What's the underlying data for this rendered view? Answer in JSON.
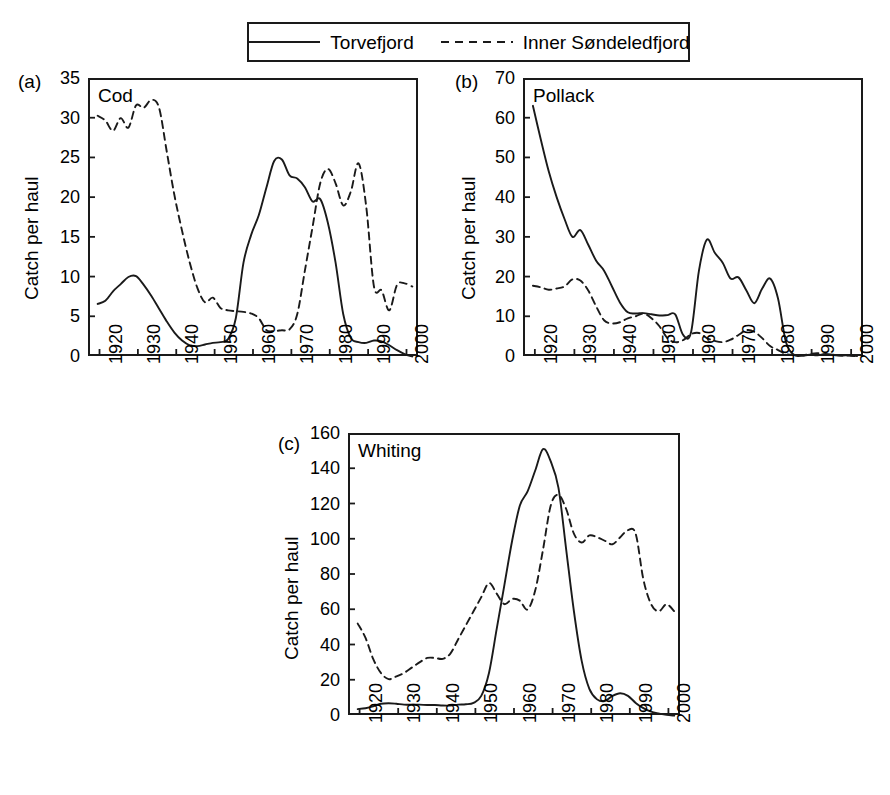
{
  "legend": {
    "entries": [
      {
        "label": "Torvefjord",
        "style": "solid",
        "icon": "solid-line-icon"
      },
      {
        "label": "Inner Søndeledfjord",
        "style": "dashed",
        "icon": "dashed-line-icon"
      }
    ]
  },
  "axis_title": "Catch per haul",
  "panels": [
    {
      "tag": "(a)",
      "title": "Cod"
    },
    {
      "tag": "(b)",
      "title": "Pollack"
    },
    {
      "tag": "(c)",
      "title": "Whiting"
    }
  ],
  "chart_data": [
    {
      "type": "line",
      "panel": "(a)",
      "title": "Cod",
      "xlabel": "",
      "ylabel": "Catch per haul",
      "xlim": [
        1917,
        2003
      ],
      "ylim": [
        0,
        35
      ],
      "yticks": [
        0,
        5,
        10,
        15,
        20,
        25,
        30,
        35
      ],
      "xticks": [
        1920,
        1930,
        1940,
        1950,
        1960,
        1970,
        1980,
        1990,
        2000
      ],
      "grid": false,
      "legend_position": "top-center-figure",
      "x": [
        1919,
        1921,
        1923,
        1925,
        1927,
        1929,
        1931,
        1933,
        1935,
        1937,
        1939,
        1941,
        1943,
        1945,
        1947,
        1949,
        1951,
        1953,
        1955,
        1957,
        1959,
        1961,
        1963,
        1965,
        1967,
        1969,
        1971,
        1973,
        1975,
        1977,
        1979,
        1981,
        1983,
        1985,
        1987,
        1989,
        1991,
        1993,
        1995,
        1997,
        1999,
        2001
      ],
      "series": [
        {
          "name": "Torvefjord",
          "style": "solid",
          "values": [
            6.8,
            7.2,
            8.4,
            9.3,
            10.2,
            10.3,
            9.2,
            7.8,
            6.2,
            4.6,
            3.2,
            2.2,
            1.6,
            1.5,
            1.7,
            1.9,
            2.0,
            2.4,
            5.0,
            12.0,
            15.5,
            18.0,
            21.5,
            24.8,
            25.0,
            23.0,
            22.6,
            21.5,
            19.7,
            20.0,
            17.0,
            12.0,
            5.5,
            2.5,
            2.0,
            1.9,
            2.2,
            2.1,
            1.6,
            1.0,
            0.5,
            0.2
          ]
        },
        {
          "name": "Inner Søndeledfjord",
          "style": "dashed",
          "values": [
            30.5,
            29.9,
            28.6,
            30.2,
            29.0,
            31.8,
            31.5,
            32.5,
            31.5,
            26.0,
            20.5,
            16.0,
            12.0,
            8.8,
            7.0,
            7.6,
            6.3,
            6.0,
            5.9,
            5.8,
            5.6,
            5.0,
            3.5,
            3.4,
            3.5,
            3.6,
            5.5,
            11.0,
            16.5,
            22.0,
            23.8,
            22.0,
            19.2,
            21.0,
            24.5,
            19.0,
            9.0,
            8.5,
            6.0,
            9.2,
            9.4,
            9.0
          ]
        }
      ]
    },
    {
      "type": "line",
      "panel": "(b)",
      "title": "Pollack",
      "xlabel": "",
      "ylabel": "Catch per haul",
      "xlim": [
        1917,
        2003
      ],
      "ylim": [
        0,
        70
      ],
      "yticks": [
        0,
        10,
        20,
        30,
        40,
        50,
        60,
        70
      ],
      "xticks": [
        1920,
        1930,
        1940,
        1950,
        1960,
        1970,
        1980,
        1990,
        2000
      ],
      "grid": false,
      "legend_position": "top-center-figure",
      "x": [
        1919,
        1921,
        1923,
        1925,
        1927,
        1929,
        1931,
        1933,
        1935,
        1937,
        1939,
        1941,
        1943,
        1945,
        1947,
        1949,
        1951,
        1953,
        1955,
        1957,
        1959,
        1961,
        1963,
        1965,
        1967,
        1969,
        1971,
        1973,
        1975,
        1977,
        1979,
        1981,
        1983,
        1985,
        1987,
        1989,
        1991,
        1993,
        1995,
        1997,
        1999,
        2001
      ],
      "series": [
        {
          "name": "Torvefjord",
          "style": "solid",
          "values": [
            63.5,
            55.0,
            47.0,
            40.5,
            35.0,
            30.5,
            32.2,
            28.5,
            24.5,
            22.0,
            18.0,
            14.0,
            11.5,
            11.2,
            11.3,
            11.0,
            10.7,
            10.8,
            11.0,
            5.8,
            6.5,
            22.0,
            29.8,
            26.5,
            24.0,
            20.0,
            20.3,
            17.0,
            13.8,
            17.5,
            20.0,
            15.0,
            4.0,
            0.8,
            0.6,
            0.8,
            0.7,
            1.0,
            0.8,
            0.6,
            0.7,
            0.5
          ]
        },
        {
          "name": "Inner Søndeledfjord",
          "style": "dashed",
          "values": [
            18.2,
            17.8,
            17.2,
            17.5,
            18.0,
            19.8,
            19.5,
            17.0,
            13.0,
            9.5,
            8.7,
            9.0,
            10.0,
            10.5,
            11.2,
            10.0,
            8.0,
            5.0,
            4.0,
            4.5,
            6.0,
            6.3,
            5.0,
            4.3,
            4.0,
            4.6,
            5.8,
            7.0,
            6.6,
            5.0,
            3.0,
            2.0,
            1.0,
            0.8,
            0.6,
            1.0,
            1.2,
            0.8,
            0.7,
            0.6,
            0.6,
            0.4
          ]
        }
      ]
    },
    {
      "type": "line",
      "panel": "(c)",
      "title": "Whiting",
      "xlabel": "",
      "ylabel": "Catch per haul",
      "xlim": [
        1917,
        2003
      ],
      "ylim": [
        0,
        160
      ],
      "yticks": [
        0,
        20,
        40,
        60,
        80,
        100,
        120,
        140,
        160
      ],
      "xticks": [
        1920,
        1930,
        1940,
        1950,
        1960,
        1970,
        1980,
        1990,
        2000
      ],
      "grid": false,
      "legend_position": "top-center-figure",
      "x": [
        1919,
        1921,
        1923,
        1925,
        1927,
        1929,
        1931,
        1933,
        1935,
        1937,
        1939,
        1941,
        1943,
        1945,
        1947,
        1949,
        1951,
        1953,
        1955,
        1957,
        1959,
        1961,
        1963,
        1965,
        1967,
        1969,
        1971,
        1973,
        1975,
        1977,
        1979,
        1981,
        1983,
        1985,
        1987,
        1989,
        1991,
        1993,
        1995,
        1997,
        1999,
        2001
      ],
      "series": [
        {
          "name": "Torvefjord",
          "style": "solid",
          "values": [
            4.5,
            5.0,
            6.0,
            7.5,
            7.8,
            7.5,
            7.0,
            7.0,
            7.0,
            6.8,
            6.8,
            6.5,
            6.5,
            7.0,
            7.2,
            8.0,
            12.0,
            25.0,
            50.0,
            75.0,
            100.0,
            120.0,
            128.0,
            140.0,
            152.0,
            145.0,
            130.0,
            95.0,
            60.0,
            32.0,
            16.0,
            10.0,
            9.0,
            12.0,
            13.5,
            12.0,
            8.0,
            5.0,
            3.0,
            2.0,
            1.2,
            0.8
          ]
        },
        {
          "name": "Inner Søndeledfjord",
          "style": "dashed",
          "values": [
            53.0,
            45.0,
            33.0,
            25.0,
            21.5,
            23.0,
            25.0,
            28.0,
            31.0,
            33.5,
            33.5,
            33.0,
            36.0,
            44.0,
            52.0,
            60.0,
            68.0,
            76.0,
            70.0,
            64.0,
            67.0,
            66.0,
            61.0,
            72.0,
            95.0,
            120.0,
            126.0,
            118.0,
            104.0,
            99.0,
            103.0,
            102.0,
            100.0,
            98.0,
            102.0,
            106.0,
            104.0,
            78.0,
            64.0,
            60.0,
            64.0,
            60.0
          ]
        }
      ]
    }
  ]
}
